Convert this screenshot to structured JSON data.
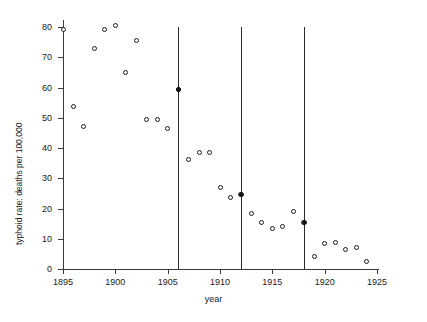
{
  "chart_data": {
    "type": "scatter",
    "title": "",
    "xlabel": "year",
    "ylabel": "typhoid rate: deaths per 100,000",
    "xlim": [
      1894,
      1925.5
    ],
    "ylim": [
      0,
      82
    ],
    "grid": false,
    "legend": "none",
    "x_ticks": [
      1895,
      1900,
      1905,
      1910,
      1915,
      1920,
      1925
    ],
    "x_tick_labels": [
      "1895",
      "1900",
      "1905",
      "1910",
      "1915",
      "1920",
      "1925"
    ],
    "y_ticks": [
      0,
      10,
      20,
      30,
      40,
      50,
      60,
      70,
      80
    ],
    "y_tick_labels": [
      "0",
      "10",
      "20",
      "30",
      "40",
      "50",
      "60",
      "70",
      "80"
    ],
    "x": [
      1895,
      1896,
      1897,
      1898,
      1899,
      1900,
      1901,
      1902,
      1903,
      1904,
      1905,
      1906,
      1907,
      1908,
      1909,
      1910,
      1911,
      1912,
      1913,
      1914,
      1915,
      1916,
      1917,
      1918,
      1919,
      1920,
      1921,
      1922,
      1923,
      1924
    ],
    "y": [
      79.3,
      53.8,
      47.2,
      72.8,
      79.2,
      80.5,
      65.0,
      75.6,
      49.5,
      49.4,
      46.6,
      59.2,
      36.2,
      38.6,
      38.5,
      27.0,
      23.7,
      24.6,
      18.2,
      15.3,
      13.3,
      14.0,
      19.0,
      15.5,
      4.2,
      8.4,
      8.8,
      6.3,
      7.2,
      2.5
    ],
    "intervention_lines": [
      {
        "year": 1906,
        "value": 59.2,
        "label": "1906"
      },
      {
        "year": 1912,
        "value": 24.6,
        "label": "1912"
      },
      {
        "year": 1918,
        "value": 15.5,
        "label": "1918"
      }
    ],
    "marker": "open-circle",
    "marker_color": "#1a1a1a",
    "line_color": "#2b2b2b"
  }
}
